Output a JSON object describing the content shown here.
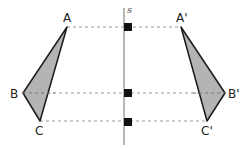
{
  "diagram": {
    "title": "",
    "axis": {
      "label": "s",
      "x": 124,
      "y1": 8,
      "y2": 145,
      "color": "#888888"
    },
    "triangle": {
      "fill": "#b4b4b4",
      "stroke": "#1a1a1a",
      "points": {
        "A": {
          "label": "A",
          "x": 67,
          "y": 27
        },
        "B": {
          "label": "B",
          "x": 23,
          "y": 93
        },
        "C": {
          "label": "C",
          "x": 40,
          "y": 121
        }
      }
    },
    "image_triangle": {
      "fill": "#b4b4b4",
      "stroke": "#1a1a1a",
      "points": {
        "A": {
          "label": "A'",
          "x": 181,
          "y": 27
        },
        "B": {
          "label": "B'",
          "x": 225,
          "y": 93
        },
        "C": {
          "label": "C'",
          "x": 207,
          "y": 121
        }
      }
    },
    "connectors": [
      {
        "from": "A",
        "to": "A'",
        "y": 27
      },
      {
        "from": "B",
        "to": "B'",
        "y": 93
      },
      {
        "from": "C",
        "to": "C'",
        "y": 121
      }
    ],
    "right_angle_markers": [
      {
        "y": 27
      },
      {
        "y": 93
      },
      {
        "y": 121
      }
    ],
    "dash_color": "#999999"
  }
}
